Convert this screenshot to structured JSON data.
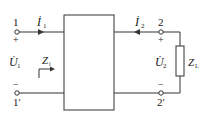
{
  "diagram": {
    "type": "two-port-network",
    "port1": {
      "terminal_top": "1",
      "terminal_bottom": "1′",
      "plus": "+",
      "minus": "−",
      "current": "İ",
      "current_sub": "1",
      "voltage": "U̇",
      "voltage_sub": "1",
      "input_impedance": "Z",
      "input_impedance_sub": "i"
    },
    "port2": {
      "terminal_top": "2",
      "terminal_bottom": "2′",
      "plus": "+",
      "minus": "−",
      "current": "İ",
      "current_sub": "2",
      "voltage": "U̇",
      "voltage_sub": "2"
    },
    "load": {
      "label": "Z",
      "label_sub": "L"
    },
    "colors": {
      "stroke": "#333333",
      "background": "#ffffff"
    }
  }
}
